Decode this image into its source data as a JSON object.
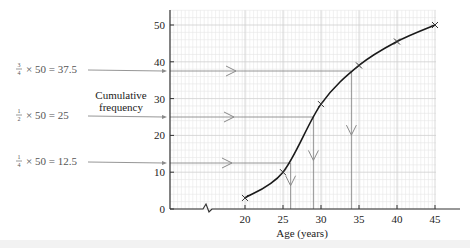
{
  "chart_data": {
    "type": "line",
    "title": "",
    "xlabel": "Age (years)",
    "ylabel": "Cumulative frequency",
    "ylabel_lines": [
      "Cumulative",
      "frequency"
    ],
    "x_ticks": [
      20,
      25,
      30,
      35,
      40,
      45
    ],
    "y_ticks": [
      0,
      10,
      20,
      30,
      40,
      50
    ],
    "xlim": [
      15,
      46
    ],
    "ylim": [
      0,
      54
    ],
    "x_axis_break": true,
    "grid": true,
    "series": [
      {
        "name": "Cumulative frequency curve",
        "x": [
          20,
          25,
          30,
          35,
          40,
          45
        ],
        "y": [
          3,
          10,
          28.5,
          39,
          45.5,
          50
        ]
      }
    ],
    "annotations": [
      {
        "label_frac": "3/4",
        "label": "× 50 = 37.5",
        "y": 37.5,
        "x_read": 34
      },
      {
        "label_frac": "1/2",
        "label": "× 50 = 25",
        "y": 25,
        "x_read": 29
      },
      {
        "label_frac": "1/4",
        "label": "× 50 = 12.5",
        "y": 12.5,
        "x_read": 26
      }
    ]
  },
  "labels": {
    "frac_num": [
      "3",
      "1",
      "1"
    ],
    "frac_den": [
      "4",
      "2",
      "4"
    ],
    "eq_text": [
      "× 50 = 37.5",
      "× 50 = 25",
      "× 50 = 12.5"
    ],
    "ylabel_1": "Cumulative",
    "ylabel_2": "frequency",
    "xlabel": "Age (years)",
    "y_ticks": [
      "0",
      "10",
      "20",
      "30",
      "40",
      "50"
    ],
    "x_ticks": [
      "20",
      "25",
      "30",
      "35",
      "40",
      "45"
    ]
  },
  "colors": {
    "grid_minor": "#e6e6e6",
    "grid_major": "#cfcfcf",
    "axis": "#333333",
    "curve": "#1a1a1a",
    "guide": "#8a8a8a",
    "label_text": "#555555"
  }
}
